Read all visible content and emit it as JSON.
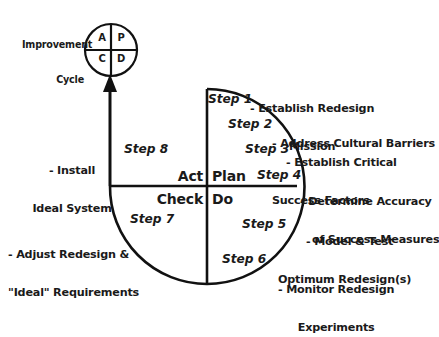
{
  "diagram": {
    "stroke_color": "#111111",
    "text_color": "#1a1a1a",
    "background": "#ffffff",
    "improvement_cycle": {
      "label_line1": "Improvement",
      "label_line2": "Cycle",
      "quadrants": {
        "act": "A",
        "plan": "P",
        "check": "C",
        "do": "D"
      }
    },
    "big_cycle_quadrants": {
      "act": "Act",
      "plan": "Plan",
      "check": "Check",
      "do": "Do"
    },
    "steps": [
      {
        "label": "Step 1"
      },
      {
        "label": "Step 2"
      },
      {
        "label": "Step 3"
      },
      {
        "label": "Step 4"
      },
      {
        "label": "Step 5"
      },
      {
        "label": "Step 6"
      },
      {
        "label": "Step 7"
      },
      {
        "label": "Step 8"
      }
    ],
    "right_annotations": [
      {
        "line1": "- Establish Redesign",
        "line2": "Mission"
      },
      {
        "line1": "- Address Cultural Barriers",
        "line2": ""
      },
      {
        "line1": "- Establish Critical",
        "line2": "Success Factors"
      },
      {
        "line1": "- Determine Accuracy",
        "line2": "of Success Measures"
      },
      {
        "line1": "- Model & Test",
        "line2": "Optimum Redesign(s)"
      },
      {
        "line1": "- Monitor Redesign",
        "line2": "Experiments"
      }
    ],
    "left_annotations": [
      {
        "line1": "- Install",
        "line2": "Ideal System"
      },
      {
        "line1": "- Adjust Redesign &",
        "line2": "\"Ideal\" Requirements"
      }
    ]
  }
}
